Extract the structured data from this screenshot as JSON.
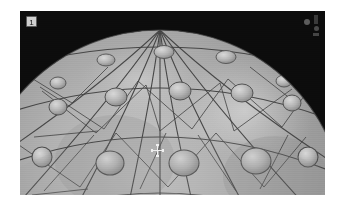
{
  "page": {
    "width": 340,
    "height": 208,
    "background_color": "#ffffff"
  },
  "viewport": {
    "name": "3d-viewport",
    "background_color": "#070707",
    "left": 20,
    "top": 11,
    "width": 305,
    "height": 184,
    "badge_label": "1",
    "badge_color": "#cfcfcf",
    "badge_text_color": "#111111"
  },
  "cursor": {
    "type": "move-crosshair",
    "x": 157,
    "y": 150,
    "color": "#efefef"
  },
  "status_indicators": [
    {
      "name": "indicator-dot-upper",
      "shape": "dot",
      "color": "#5c5c5c"
    },
    {
      "name": "indicator-dot-lower",
      "shape": "dot",
      "color": "#4a4a4a"
    },
    {
      "name": "indicator-square",
      "shape": "square",
      "color": "#3a3a3a"
    }
  ],
  "scene": {
    "object_name": "geodesic-sphere",
    "object_type": "geodesic dome / triangulated sphere",
    "shading": "flat-grey",
    "wireframe": true,
    "wireframe_color": "#3a3a3a",
    "surface_color_base": "#9a9a9a",
    "surface_color_light": "#c2c2c2",
    "surface_color_dark": "#6d6d6d",
    "highlight_color": "#d6d6d6",
    "node_cap_color": "#b4b4b4",
    "node_cap_edge_color": "#4f4f4f",
    "center_x": 160,
    "center_y": 215,
    "radius": 185,
    "node_count": 24,
    "latitude_bands": 4,
    "longitude_segments": 12
  }
}
